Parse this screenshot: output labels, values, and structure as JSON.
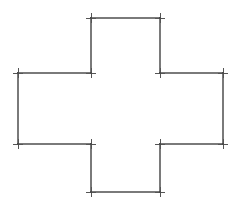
{
  "figure": {
    "background_color": "#ffffff",
    "line_color": "#7a7a7a",
    "marker_color": "#555555",
    "line_width": 1.1,
    "marker_style": "plus-tick",
    "marker_arm_length": 5,
    "canvas_width": 247,
    "canvas_height": 209
  },
  "chart_data": {
    "type": "scatter",
    "xlabel": "",
    "ylabel": "",
    "xlim": [
      0,
      247
    ],
    "ylim": [
      0,
      209
    ],
    "grid": false,
    "legend": null,
    "shape": "cross",
    "closed": true,
    "vertex_count": 12,
    "series": [
      {
        "name": "polygon-vertices",
        "marker": "plus",
        "x": [
          91,
          160,
          160,
          223,
          223,
          160,
          160,
          91,
          91,
          18,
          18,
          91
        ],
        "y": [
          18,
          18,
          73,
          73,
          144,
          144,
          192,
          192,
          144,
          144,
          73,
          73
        ]
      }
    ],
    "vertices": [
      {
        "id": "v1",
        "label": "top-arm-left",
        "x": 91,
        "y": 18
      },
      {
        "id": "v2",
        "label": "top-arm-right",
        "x": 160,
        "y": 18
      },
      {
        "id": "v3",
        "label": "upper-right-inner",
        "x": 160,
        "y": 73
      },
      {
        "id": "v4",
        "label": "right-arm-top",
        "x": 223,
        "y": 73
      },
      {
        "id": "v5",
        "label": "right-arm-bottom",
        "x": 223,
        "y": 144
      },
      {
        "id": "v6",
        "label": "lower-right-inner",
        "x": 160,
        "y": 144
      },
      {
        "id": "v7",
        "label": "bottom-arm-right",
        "x": 160,
        "y": 192
      },
      {
        "id": "v8",
        "label": "bottom-arm-left",
        "x": 91,
        "y": 192
      },
      {
        "id": "v9",
        "label": "lower-left-inner",
        "x": 91,
        "y": 144
      },
      {
        "id": "v10",
        "label": "left-arm-bottom",
        "x": 18,
        "y": 144
      },
      {
        "id": "v11",
        "label": "left-arm-top",
        "x": 18,
        "y": 73
      },
      {
        "id": "v12",
        "label": "upper-left-inner",
        "x": 91,
        "y": 73
      }
    ],
    "edges": [
      {
        "from": "v1",
        "to": "v2",
        "orientation": "horizontal",
        "length": 69
      },
      {
        "from": "v2",
        "to": "v3",
        "orientation": "vertical",
        "length": 55
      },
      {
        "from": "v3",
        "to": "v4",
        "orientation": "horizontal",
        "length": 63
      },
      {
        "from": "v4",
        "to": "v5",
        "orientation": "vertical",
        "length": 71
      },
      {
        "from": "v5",
        "to": "v6",
        "orientation": "horizontal",
        "length": 63
      },
      {
        "from": "v6",
        "to": "v7",
        "orientation": "vertical",
        "length": 48
      },
      {
        "from": "v7",
        "to": "v8",
        "orientation": "horizontal",
        "length": 69
      },
      {
        "from": "v8",
        "to": "v9",
        "orientation": "vertical",
        "length": 48
      },
      {
        "from": "v9",
        "to": "v10",
        "orientation": "horizontal",
        "length": 73
      },
      {
        "from": "v10",
        "to": "v11",
        "orientation": "vertical",
        "length": 71
      },
      {
        "from": "v11",
        "to": "v12",
        "orientation": "horizontal",
        "length": 73
      },
      {
        "from": "v12",
        "to": "v1",
        "orientation": "vertical",
        "length": 55
      }
    ]
  }
}
